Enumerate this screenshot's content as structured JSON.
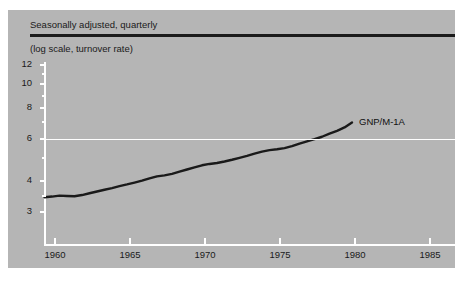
{
  "figure": {
    "caption_clipped": "FIGURE 4"
  },
  "header": {
    "line1": "Seasonally adjusted, quarterly",
    "line2": "(log scale, turnover rate)"
  },
  "chart_data": {
    "type": "line",
    "title": "",
    "subtitle": "Seasonally adjusted, quarterly",
    "note": "(log scale, turnover rate)",
    "xlabel": "",
    "ylabel": "",
    "yscale": "log",
    "ylim": [
      2.6,
      13.0
    ],
    "xlim": [
      1958.2,
      1986.2
    ],
    "grid": false,
    "gridlines_highlighted": [
      6
    ],
    "legend_position": "inline-end-of-line",
    "y_ticks_labeled": [
      12,
      10,
      8,
      6,
      4,
      3
    ],
    "y_ticks_minor": [
      11,
      9,
      7,
      5,
      3.5
    ],
    "x_ticks": [
      1960,
      1965,
      1970,
      1975,
      1980,
      1985
    ],
    "series": [
      {
        "name": "GNP/M-1A",
        "color": "#1a1a1a",
        "x": [
          1959.3,
          1959.8,
          1960.3,
          1960.8,
          1961.3,
          1961.8,
          1962.3,
          1962.8,
          1963.3,
          1963.8,
          1964.3,
          1964.8,
          1965.3,
          1965.8,
          1966.3,
          1966.8,
          1967.3,
          1967.8,
          1968.3,
          1968.8,
          1969.3,
          1969.8,
          1970.3,
          1970.8,
          1971.3,
          1971.8,
          1972.3,
          1972.8,
          1973.3,
          1973.8,
          1974.3,
          1974.8,
          1975.3,
          1975.8,
          1976.3,
          1976.8,
          1977.3,
          1977.8,
          1978.3,
          1978.8,
          1979.3,
          1979.8
        ],
        "values": [
          3.45,
          3.47,
          3.5,
          3.49,
          3.48,
          3.52,
          3.58,
          3.64,
          3.7,
          3.76,
          3.83,
          3.89,
          3.96,
          4.03,
          4.12,
          4.2,
          4.24,
          4.3,
          4.39,
          4.48,
          4.57,
          4.66,
          4.72,
          4.76,
          4.83,
          4.91,
          5.0,
          5.09,
          5.2,
          5.3,
          5.38,
          5.42,
          5.48,
          5.58,
          5.72,
          5.84,
          5.96,
          6.1,
          6.28,
          6.45,
          6.66,
          6.98
        ]
      }
    ]
  }
}
